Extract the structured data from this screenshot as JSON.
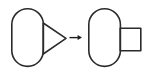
{
  "diagram": {
    "title": "Shape transformation: triangle appendage becomes rectangle appendage",
    "type": "shape-transformation",
    "canvas": {
      "width": 151,
      "height": 74,
      "background": "#ffffff"
    },
    "stroke_color": "#2b2b2b",
    "arrow_color": "#1e1e1e",
    "stroke_width": 1.6,
    "left_group": {
      "label": "source-shape",
      "body": {
        "name": "capsule",
        "shape": "stadium",
        "x": 11,
        "y": 8,
        "width": 33,
        "height": 59,
        "radius": 16.5,
        "fill": "none"
      },
      "appendage": {
        "name": "triangle",
        "shape": "triangle-right",
        "points": "43,23 43,54 66,38",
        "apex_x": 66,
        "apex_y": 38,
        "base_x": 43,
        "base_top_y": 23,
        "base_bottom_y": 54,
        "fill": "none"
      }
    },
    "connector": {
      "label": "transforms-to-arrow",
      "glyph": "→",
      "x1": 70,
      "y1": 37.5,
      "x2": 79,
      "y2": 37.5,
      "head_points": "82,37.5 78,35.2 78,39.8"
    },
    "right_group": {
      "label": "result-shape",
      "body": {
        "name": "capsule",
        "shape": "stadium",
        "x": 88,
        "y": 8,
        "width": 33,
        "height": 59,
        "radius": 16.5,
        "fill": "none"
      },
      "appendage": {
        "name": "rectangle",
        "shape": "rectangle",
        "x": 120,
        "y": 28,
        "width": 21,
        "height": 23,
        "fill": "none"
      }
    }
  }
}
